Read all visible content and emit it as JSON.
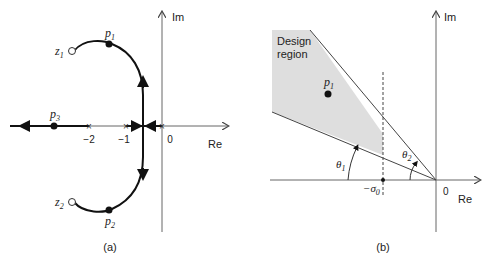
{
  "panel_a": {
    "caption": "(a)",
    "axes": {
      "x_label": "Re",
      "y_label": "Im"
    },
    "ticks": [
      {
        "label": "−2",
        "value": -2
      },
      {
        "label": "−1",
        "value": -1
      },
      {
        "label": "0",
        "value": 0
      }
    ],
    "poles_closed_loop": [
      {
        "name": "p",
        "sub": "1"
      },
      {
        "name": "p",
        "sub": "2"
      },
      {
        "name": "p",
        "sub": "3"
      }
    ],
    "zeros": [
      {
        "name": "z",
        "sub": "1"
      },
      {
        "name": "z",
        "sub": "2"
      }
    ]
  },
  "panel_b": {
    "caption": "(b)",
    "axes": {
      "x_label": "Re",
      "y_label": "Im"
    },
    "origin_label": "0",
    "region_label_line1": "Design",
    "region_label_line2": "region",
    "pole": {
      "name": "p",
      "sub": "1"
    },
    "sigma": {
      "prefix": "−σ",
      "sub": "0"
    },
    "theta1": {
      "name": "θ",
      "sub": "1"
    },
    "theta2": {
      "name": "θ",
      "sub": "2"
    }
  },
  "colors": {
    "line": "#222222",
    "axis": "#555555",
    "region": "#dcdcdc"
  }
}
